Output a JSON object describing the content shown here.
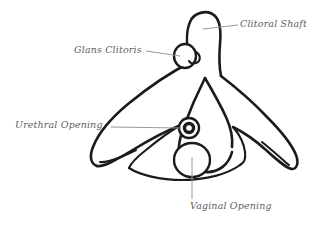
{
  "figure": {
    "background_color": "#ffffff",
    "outline_color": "#1b1b1b",
    "leader_color": "#9a9a9a",
    "label_color": "#5e5e5e"
  },
  "labels": {
    "clitoral_shaft": "Clitoral Shaft",
    "glans_clitoris": "Glans Clitoris",
    "urethral_opening": "Urethral Opening",
    "vaginal_opening": "Vaginal Opening"
  },
  "parts": [
    {
      "name": "clitoral-shaft",
      "label": "Clitoral Shaft"
    },
    {
      "name": "glans-clitoris",
      "label": "Glans Clitoris"
    },
    {
      "name": "urethral-opening",
      "label": "Urethral Opening"
    },
    {
      "name": "vaginal-opening",
      "label": "Vaginal Opening"
    }
  ]
}
